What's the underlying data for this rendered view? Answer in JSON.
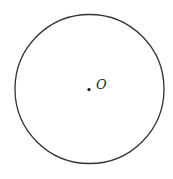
{
  "diagram": {
    "type": "geometry-circle",
    "circle": {
      "cx": 89.5,
      "cy": 89,
      "r": 74.5,
      "stroke": "#333333",
      "stroke_width": 1.3,
      "fill": "none"
    },
    "center_point": {
      "x": 89,
      "y": 89.5,
      "r": 1.6,
      "color": "#111111",
      "label": "O",
      "label_x": 96,
      "label_y": 89
    }
  }
}
